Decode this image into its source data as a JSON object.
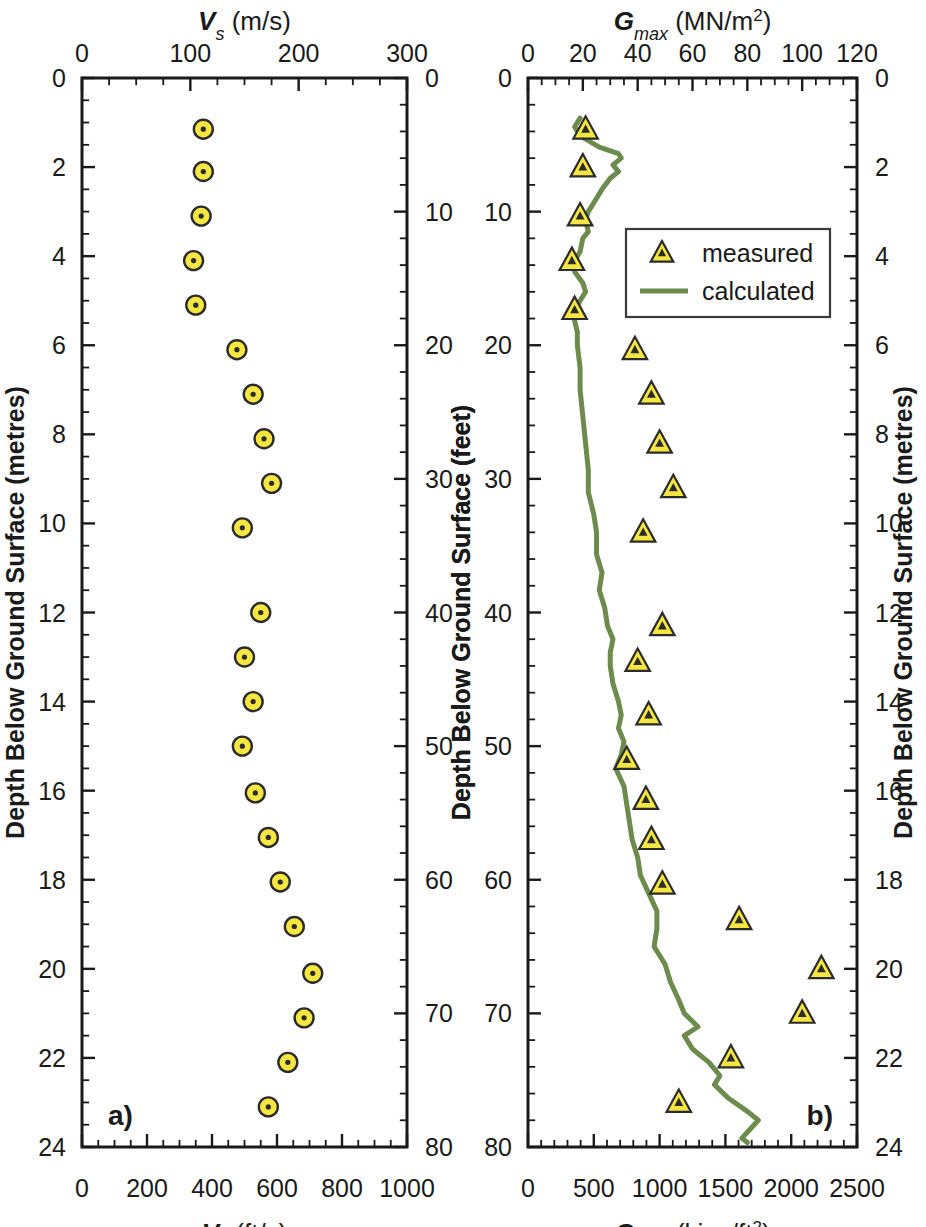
{
  "figure": {
    "panel_a_label": "a)",
    "panel_b_label": "b)"
  },
  "chart_data": [
    {
      "type": "scatter",
      "panel": "a",
      "title": "",
      "xlabel_top": "Vs (m/s)",
      "xlabel_top_parts": {
        "sym": "V",
        "sub": "s",
        "unit": " (m/s)"
      },
      "xlabel_bottom": "Vs (ft/s)",
      "xlabel_bottom_parts": {
        "sym": "V",
        "sub": "s",
        "unit": " (ft/s)"
      },
      "ylabel_left": "Depth Below Ground Surface (metres)",
      "ylabel_right": "Depth Below Ground Surface (feet)",
      "xlim_top": [
        0,
        300
      ],
      "xticks_top": [
        0,
        100,
        200,
        300
      ],
      "xlim_bottom": [
        0,
        1000
      ],
      "xticks_bottom": [
        0,
        200,
        400,
        600,
        800,
        1000
      ],
      "ylim_left": [
        0,
        24
      ],
      "yticks_left": [
        0,
        2,
        4,
        6,
        8,
        10,
        12,
        14,
        16,
        18,
        20,
        22,
        24
      ],
      "ylim_right": [
        0,
        80
      ],
      "yticks_right": [
        0,
        10,
        20,
        30,
        40,
        50,
        60,
        70,
        80
      ],
      "grid": false,
      "legend": null,
      "series": [
        {
          "name": "Vs",
          "marker": "circle-dot",
          "color": "#f5e642",
          "points": [
            {
              "depth_m": 1.15,
              "vs_mps": 112
            },
            {
              "depth_m": 2.1,
              "vs_mps": 112
            },
            {
              "depth_m": 3.1,
              "vs_mps": 110
            },
            {
              "depth_m": 4.1,
              "vs_mps": 103
            },
            {
              "depth_m": 5.1,
              "vs_mps": 105
            },
            {
              "depth_m": 6.1,
              "vs_mps": 143
            },
            {
              "depth_m": 7.1,
              "vs_mps": 158
            },
            {
              "depth_m": 8.1,
              "vs_mps": 168
            },
            {
              "depth_m": 9.1,
              "vs_mps": 175
            },
            {
              "depth_m": 10.1,
              "vs_mps": 148
            },
            {
              "depth_m": 12.0,
              "vs_mps": 165
            },
            {
              "depth_m": 13.0,
              "vs_mps": 150
            },
            {
              "depth_m": 14.0,
              "vs_mps": 158
            },
            {
              "depth_m": 15.0,
              "vs_mps": 148
            },
            {
              "depth_m": 16.05,
              "vs_mps": 160
            },
            {
              "depth_m": 17.05,
              "vs_mps": 172
            },
            {
              "depth_m": 18.05,
              "vs_mps": 183
            },
            {
              "depth_m": 19.05,
              "vs_mps": 196
            },
            {
              "depth_m": 20.1,
              "vs_mps": 213
            },
            {
              "depth_m": 21.1,
              "vs_mps": 205
            },
            {
              "depth_m": 22.1,
              "vs_mps": 190
            },
            {
              "depth_m": 23.1,
              "vs_mps": 172
            }
          ]
        }
      ]
    },
    {
      "type": "scatter",
      "panel": "b",
      "title": "",
      "xlabel_top": "Gmax (MN/m2)",
      "xlabel_top_parts": {
        "sym": "G",
        "sub": "max",
        "unit": " (MN/m",
        "sup": "2",
        "tail": ")"
      },
      "xlabel_bottom": "Gmax (kips/ft2)",
      "xlabel_bottom_parts": {
        "sym": "G",
        "sub": "max",
        "unit": " (kips/ft",
        "sup": "2",
        "tail": ")"
      },
      "ylabel_left": "Depth Below Ground Surface (feet)",
      "ylabel_right": "Depth Below Ground Surface (metres)",
      "xlim_top": [
        0,
        120
      ],
      "xticks_top": [
        0,
        20,
        40,
        60,
        80,
        100,
        120
      ],
      "xlim_bottom": [
        0,
        2500
      ],
      "xticks_bottom": [
        0,
        500,
        1000,
        1500,
        2000,
        2500
      ],
      "ylim_left": [
        0,
        80
      ],
      "yticks_left": [
        0,
        10,
        20,
        30,
        40,
        50,
        60,
        70,
        80
      ],
      "ylim_right": [
        0,
        24
      ],
      "yticks_right": [
        0,
        2,
        4,
        6,
        8,
        10,
        12,
        14,
        16,
        18,
        20,
        22,
        24
      ],
      "grid": false,
      "legend": {
        "position": "upper-right-inside",
        "entries": [
          {
            "label": "measured",
            "marker": "triangle",
            "color": "#f5e642"
          },
          {
            "label": "calculated",
            "marker": "line",
            "color": "#6e8b4e"
          }
        ]
      },
      "series": [
        {
          "name": "measured",
          "marker": "triangle",
          "color": "#f5e642",
          "points": [
            {
              "depth_m": 1.15,
              "gmax_mn": 21
            },
            {
              "depth_m": 2.0,
              "gmax_mn": 20
            },
            {
              "depth_m": 3.1,
              "gmax_mn": 19
            },
            {
              "depth_m": 4.1,
              "gmax_mn": 16
            },
            {
              "depth_m": 5.2,
              "gmax_mn": 17
            },
            {
              "depth_m": 6.1,
              "gmax_mn": 39
            },
            {
              "depth_m": 7.1,
              "gmax_mn": 45
            },
            {
              "depth_m": 8.2,
              "gmax_mn": 48
            },
            {
              "depth_m": 9.2,
              "gmax_mn": 53
            },
            {
              "depth_m": 10.2,
              "gmax_mn": 42
            },
            {
              "depth_m": 12.3,
              "gmax_mn": 49
            },
            {
              "depth_m": 13.1,
              "gmax_mn": 40
            },
            {
              "depth_m": 14.3,
              "gmax_mn": 44
            },
            {
              "depth_m": 15.3,
              "gmax_mn": 36
            },
            {
              "depth_m": 16.2,
              "gmax_mn": 43
            },
            {
              "depth_m": 17.1,
              "gmax_mn": 45
            },
            {
              "depth_m": 18.1,
              "gmax_mn": 49
            },
            {
              "depth_m": 18.9,
              "gmax_mn": 77
            },
            {
              "depth_m": 20.0,
              "gmax_mn": 107
            },
            {
              "depth_m": 21.0,
              "gmax_mn": 100
            },
            {
              "depth_m": 22.0,
              "gmax_mn": 74
            },
            {
              "depth_m": 23.0,
              "gmax_mn": 55
            }
          ]
        },
        {
          "name": "calculated",
          "marker": "line",
          "color": "#6e8b4e",
          "points": [
            {
              "depth_m": 0.9,
              "gmax_mn": 19
            },
            {
              "depth_m": 1.1,
              "gmax_mn": 17
            },
            {
              "depth_m": 1.3,
              "gmax_mn": 19
            },
            {
              "depth_m": 1.55,
              "gmax_mn": 26
            },
            {
              "depth_m": 1.7,
              "gmax_mn": 33
            },
            {
              "depth_m": 1.8,
              "gmax_mn": 34
            },
            {
              "depth_m": 1.95,
              "gmax_mn": 31
            },
            {
              "depth_m": 2.1,
              "gmax_mn": 33
            },
            {
              "depth_m": 2.25,
              "gmax_mn": 30
            },
            {
              "depth_m": 2.5,
              "gmax_mn": 27
            },
            {
              "depth_m": 2.8,
              "gmax_mn": 24
            },
            {
              "depth_m": 3.0,
              "gmax_mn": 22
            },
            {
              "depth_m": 3.2,
              "gmax_mn": 21
            },
            {
              "depth_m": 3.45,
              "gmax_mn": 22
            },
            {
              "depth_m": 3.6,
              "gmax_mn": 20
            },
            {
              "depth_m": 3.9,
              "gmax_mn": 19
            },
            {
              "depth_m": 4.1,
              "gmax_mn": 17
            },
            {
              "depth_m": 4.35,
              "gmax_mn": 17
            },
            {
              "depth_m": 4.6,
              "gmax_mn": 20
            },
            {
              "depth_m": 4.8,
              "gmax_mn": 21
            },
            {
              "depth_m": 5.0,
              "gmax_mn": 19
            },
            {
              "depth_m": 5.2,
              "gmax_mn": 17
            },
            {
              "depth_m": 5.45,
              "gmax_mn": 17
            },
            {
              "depth_m": 5.7,
              "gmax_mn": 18
            },
            {
              "depth_m": 6.0,
              "gmax_mn": 18
            },
            {
              "depth_m": 6.5,
              "gmax_mn": 19
            },
            {
              "depth_m": 7.0,
              "gmax_mn": 19
            },
            {
              "depth_m": 7.6,
              "gmax_mn": 20
            },
            {
              "depth_m": 8.2,
              "gmax_mn": 21
            },
            {
              "depth_m": 8.8,
              "gmax_mn": 22
            },
            {
              "depth_m": 9.3,
              "gmax_mn": 22
            },
            {
              "depth_m": 9.8,
              "gmax_mn": 24
            },
            {
              "depth_m": 10.2,
              "gmax_mn": 25
            },
            {
              "depth_m": 10.7,
              "gmax_mn": 25
            },
            {
              "depth_m": 11.1,
              "gmax_mn": 27
            },
            {
              "depth_m": 11.5,
              "gmax_mn": 26
            },
            {
              "depth_m": 11.9,
              "gmax_mn": 28
            },
            {
              "depth_m": 12.3,
              "gmax_mn": 29
            },
            {
              "depth_m": 12.6,
              "gmax_mn": 31
            },
            {
              "depth_m": 12.9,
              "gmax_mn": 30
            },
            {
              "depth_m": 13.2,
              "gmax_mn": 30
            },
            {
              "depth_m": 13.6,
              "gmax_mn": 31
            },
            {
              "depth_m": 14.0,
              "gmax_mn": 33
            },
            {
              "depth_m": 14.3,
              "gmax_mn": 34
            },
            {
              "depth_m": 14.6,
              "gmax_mn": 33
            },
            {
              "depth_m": 14.9,
              "gmax_mn": 35
            },
            {
              "depth_m": 15.2,
              "gmax_mn": 34
            },
            {
              "depth_m": 15.5,
              "gmax_mn": 32
            },
            {
              "depth_m": 15.9,
              "gmax_mn": 35
            },
            {
              "depth_m": 16.3,
              "gmax_mn": 36
            },
            {
              "depth_m": 16.7,
              "gmax_mn": 37
            },
            {
              "depth_m": 17.1,
              "gmax_mn": 38
            },
            {
              "depth_m": 17.5,
              "gmax_mn": 40
            },
            {
              "depth_m": 17.9,
              "gmax_mn": 41
            },
            {
              "depth_m": 18.3,
              "gmax_mn": 44
            },
            {
              "depth_m": 18.7,
              "gmax_mn": 47
            },
            {
              "depth_m": 19.1,
              "gmax_mn": 47
            },
            {
              "depth_m": 19.5,
              "gmax_mn": 46
            },
            {
              "depth_m": 19.9,
              "gmax_mn": 50
            },
            {
              "depth_m": 20.3,
              "gmax_mn": 52
            },
            {
              "depth_m": 20.7,
              "gmax_mn": 55
            },
            {
              "depth_m": 21.0,
              "gmax_mn": 57
            },
            {
              "depth_m": 21.3,
              "gmax_mn": 62
            },
            {
              "depth_m": 21.5,
              "gmax_mn": 57
            },
            {
              "depth_m": 21.8,
              "gmax_mn": 60
            },
            {
              "depth_m": 22.1,
              "gmax_mn": 66
            },
            {
              "depth_m": 22.4,
              "gmax_mn": 70
            },
            {
              "depth_m": 22.6,
              "gmax_mn": 68
            },
            {
              "depth_m": 22.9,
              "gmax_mn": 73
            },
            {
              "depth_m": 23.2,
              "gmax_mn": 80
            },
            {
              "depth_m": 23.4,
              "gmax_mn": 84
            },
            {
              "depth_m": 23.6,
              "gmax_mn": 81
            },
            {
              "depth_m": 23.8,
              "gmax_mn": 78
            },
            {
              "depth_m": 23.9,
              "gmax_mn": 80
            }
          ]
        }
      ]
    }
  ]
}
